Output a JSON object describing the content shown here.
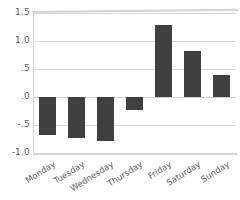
{
  "chart_data": {
    "type": "bar",
    "title": "",
    "subtitle": "",
    "xlabel": "",
    "ylabel": "",
    "categories": [
      "Monday",
      "Tuesday",
      "Wednesday",
      "Thursday",
      "Friday",
      "Saturday",
      "Sunday"
    ],
    "values": [
      -0.68,
      -0.73,
      -0.78,
      -0.23,
      1.29,
      0.83,
      0.4
    ],
    "ylim": [
      -1.0,
      1.5
    ],
    "yticks": [
      1.5,
      1.0,
      0.5,
      0.0,
      -0.5,
      -1.0
    ],
    "ytick_labels": [
      "1.5",
      "1.0",
      ".5",
      ".0",
      "-.5",
      "-1.0"
    ],
    "grid": true,
    "grid_axis": "y",
    "legend": false,
    "legend_position": "none",
    "bar_color": "#404040",
    "grid_color": "#d9d9d9",
    "axis_color": "#d2d2d2",
    "tick_label_color": "#58595b",
    "background_color": "#ffffff",
    "xtick_rotation": -32
  }
}
